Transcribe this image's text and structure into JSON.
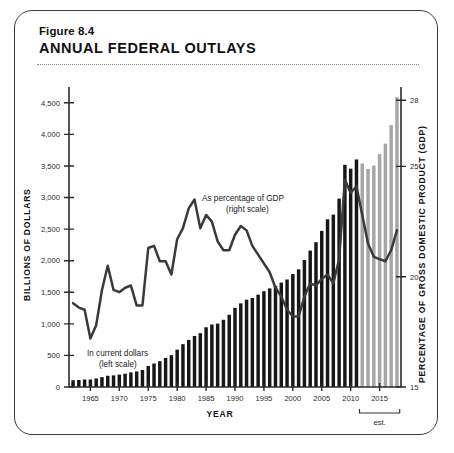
{
  "figure": {
    "number": "Figure 8.4",
    "title": "ANNUAL FEDERAL OUTLAYS"
  },
  "annotations": {
    "bars_line1": "In current dollars",
    "bars_line2": "(left scale)",
    "line_line1": "As percentage of GDP",
    "line_line2": "(right scale)",
    "est_label": "est."
  },
  "axes": {
    "left_title": "BILLIONS OF DOLLARS",
    "right_title": "PERCENTAGE OF GROSS DOMESTIC PRODUCT (GDP)",
    "x_title": "YEAR",
    "left_ticks": [
      "0",
      "500",
      "1,000",
      "1,500",
      "2,000",
      "2,500",
      "3,000",
      "3,500",
      "4,000",
      "4,500"
    ],
    "right_ticks": [
      "15",
      "20",
      "25",
      "28"
    ],
    "x_ticks": [
      "1965",
      "1970",
      "1975",
      "1980",
      "1985",
      "1990",
      "1995",
      "2000",
      "2005",
      "2010",
      "2015"
    ]
  },
  "colors": {
    "bar_actual": "#171717",
    "bar_estimated": "#a6a6a6",
    "line": "#3a3a3a",
    "card_border": "#3b3b3b",
    "rule": "#8a8a8a"
  },
  "chart_data": {
    "type": "bar",
    "title": "ANNUAL FEDERAL OUTLAYS",
    "subtitle": "Figure 8.4",
    "xlabel": "YEAR",
    "ylabel": "BILLIONS OF DOLLARS",
    "y2label": "PERCENTAGE OF GROSS DOMESTIC PRODUCT (GDP)",
    "ylim": [
      0,
      4750
    ],
    "y2lim": [
      15,
      28.6
    ],
    "xlim": [
      1961.3,
      2018.7
    ],
    "grid": false,
    "legend": "inline-annotations",
    "estimate_start_year": 2012,
    "x": [
      1962,
      1963,
      1964,
      1965,
      1966,
      1967,
      1968,
      1969,
      1970,
      1971,
      1972,
      1973,
      1974,
      1975,
      1976,
      1977,
      1978,
      1979,
      1980,
      1981,
      1982,
      1983,
      1984,
      1985,
      1986,
      1987,
      1988,
      1989,
      1990,
      1991,
      1992,
      1993,
      1994,
      1995,
      1996,
      1997,
      1998,
      1999,
      2000,
      2001,
      2002,
      2003,
      2004,
      2005,
      2006,
      2007,
      2008,
      2009,
      2010,
      2011,
      2012,
      2013,
      2014,
      2015,
      2016,
      2017,
      2018
    ],
    "series": [
      {
        "name": "In current dollars (left scale)",
        "type": "bar",
        "axis": "left",
        "unit": "billions of dollars",
        "values": [
          107,
          111,
          119,
          118,
          135,
          157,
          178,
          184,
          196,
          210,
          231,
          246,
          269,
          332,
          372,
          409,
          459,
          504,
          591,
          678,
          746,
          808,
          852,
          946,
          990,
          1004,
          1064,
          1144,
          1253,
          1324,
          1382,
          1409,
          1462,
          1516,
          1561,
          1601,
          1653,
          1702,
          1789,
          1863,
          2011,
          2160,
          2293,
          2472,
          2655,
          2729,
          2983,
          3518,
          3457,
          3603,
          3537,
          3455,
          3506,
          3688,
          3853,
          4147,
          4590
        ]
      },
      {
        "name": "As percentage of GDP (right scale)",
        "type": "line",
        "axis": "right",
        "unit": "percent of GDP",
        "values": [
          18.8,
          18.6,
          18.5,
          17.2,
          17.8,
          19.4,
          20.5,
          19.4,
          19.3,
          19.5,
          19.6,
          18.7,
          18.7,
          21.3,
          21.4,
          20.7,
          20.7,
          20.1,
          21.7,
          22.2,
          23.1,
          23.5,
          22.2,
          22.8,
          22.5,
          21.6,
          21.2,
          21.2,
          21.9,
          22.3,
          22.1,
          21.4,
          21.0,
          20.6,
          20.2,
          19.5,
          19.1,
          18.5,
          18.2,
          18.2,
          19.1,
          19.7,
          19.6,
          19.9,
          20.1,
          19.7,
          20.8,
          24.4,
          23.8,
          24.1,
          22.8,
          21.5,
          20.9,
          20.8,
          20.7,
          21.2,
          22.1
        ]
      }
    ]
  }
}
